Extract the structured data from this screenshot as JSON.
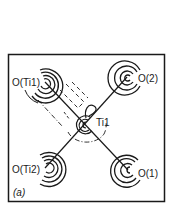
{
  "figure": {
    "panel_label": "(a)",
    "atoms": [
      {
        "id": "O(Ti1)",
        "label": "O(Ti1)",
        "x": 45,
        "y": 82
      },
      {
        "id": "O(2)",
        "label": "O(2)",
        "x": 127,
        "y": 77
      },
      {
        "id": "Ti1",
        "label": "Ti1",
        "x": 85,
        "y": 125
      },
      {
        "id": "O(Ti2)",
        "label": "O(Ti2)",
        "x": 45,
        "y": 168
      },
      {
        "id": "O(1)",
        "label": "O(1)",
        "x": 128,
        "y": 170
      }
    ],
    "bonds": [
      [
        "O(Ti1)",
        "O(1)"
      ],
      [
        "O(2)",
        "O(Ti2)"
      ]
    ],
    "colors": {
      "ink": "#1a1a1a",
      "background": "#ffffff"
    }
  }
}
